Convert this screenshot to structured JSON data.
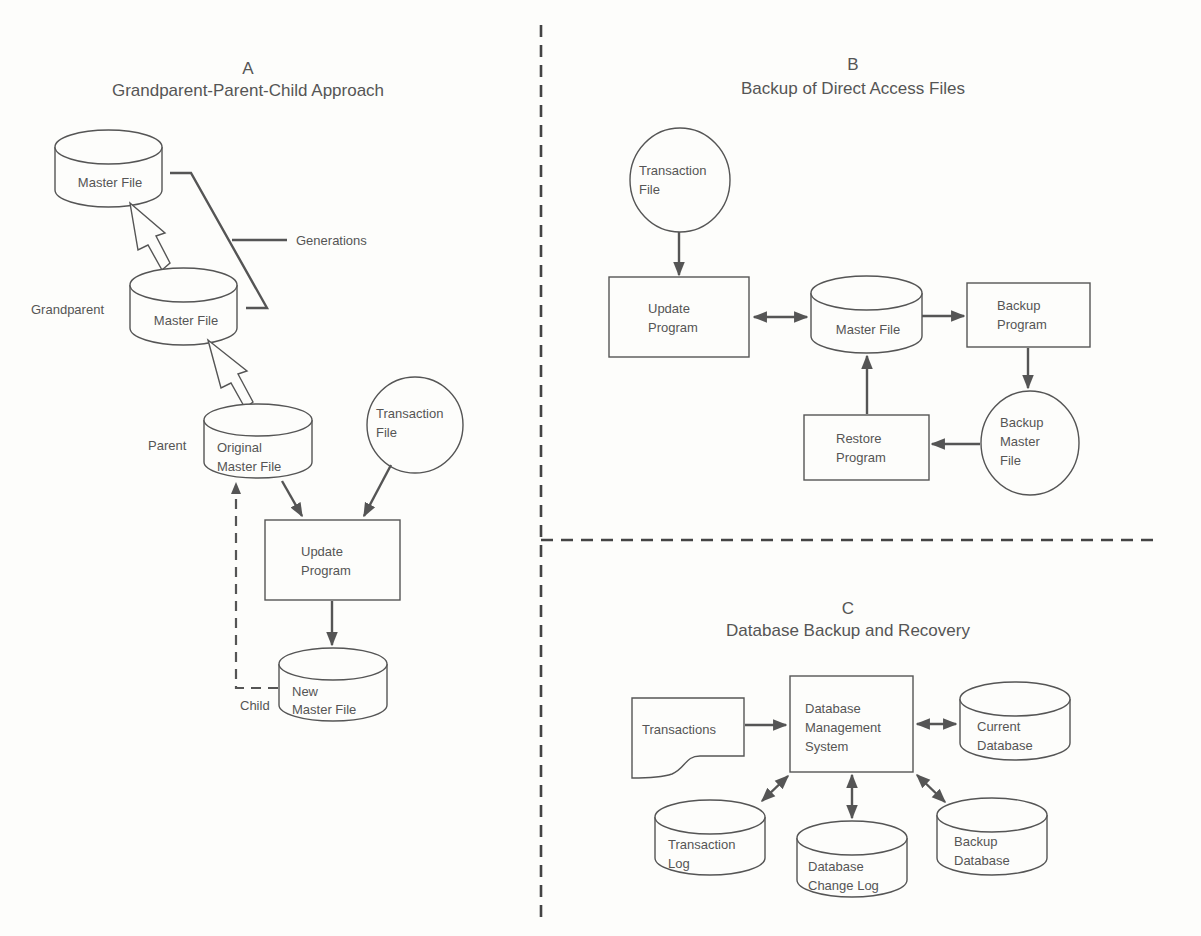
{
  "panels": {
    "a": {
      "letter": "A",
      "title": "Grandparent-Parent-Child Approach",
      "master_top": "Master File",
      "grandparent_label": "Grandparent",
      "master_grandparent": "Master File",
      "generations_label": "Generations",
      "parent_label": "Parent",
      "original_line1": "Original",
      "original_line2": "Master File",
      "transaction_line1": "Transaction",
      "transaction_line2": "File",
      "update_line1": "Update",
      "update_line2": "Program",
      "child_label": "Child",
      "new_line1": "New",
      "new_line2": "Master File"
    },
    "b": {
      "letter": "B",
      "title": "Backup of Direct Access Files",
      "transaction_line1": "Transaction",
      "transaction_line2": "File",
      "update_line1": "Update",
      "update_line2": "Program",
      "master_file": "Master File",
      "backup_line1": "Backup",
      "backup_line2": "Program",
      "restore_line1": "Restore",
      "restore_line2": "Program",
      "backup_master_line1": "Backup",
      "backup_master_line2": "Master",
      "backup_master_line3": "File"
    },
    "c": {
      "letter": "C",
      "title": "Database Backup and Recovery",
      "transactions": "Transactions",
      "dbms_line1": "Database",
      "dbms_line2": "Management",
      "dbms_line3": "System",
      "current_line1": "Current",
      "current_line2": "Database",
      "txlog_line1": "Transaction",
      "txlog_line2": "Log",
      "changelog_line1": "Database",
      "changelog_line2": "Change Log",
      "backupdb_line1": "Backup",
      "backupdb_line2": "Database"
    }
  },
  "colors": {
    "ink": "#555555",
    "paper": "#fdfdfb"
  }
}
